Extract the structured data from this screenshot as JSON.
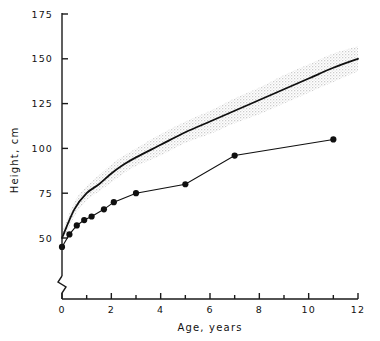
{
  "figure": {
    "name": "growth-chart",
    "background_color": "#ffffff",
    "axis_color": "#1a1a1a",
    "band_color": "#dcdcdc",
    "reference_curve_color": "#101010",
    "patient_curve_color": "#101010"
  },
  "chart_data": {
    "type": "line",
    "title": "",
    "xlabel": "Age, years",
    "ylabel": "Height, cm",
    "xlim": [
      0,
      12
    ],
    "ylim": [
      40,
      175
    ],
    "grid": false,
    "legend": "none",
    "y_axis_break": true,
    "y_axis_break_note": "axis broken between 0 and 40 cm",
    "xticks": [
      0,
      2,
      4,
      6,
      8,
      10,
      12
    ],
    "xtick_labels": [
      "0",
      "2",
      "4",
      "6",
      "8",
      "10",
      "12"
    ],
    "x_minor_ticks": [
      1,
      3,
      5,
      7,
      9,
      11
    ],
    "yticks": [
      50,
      75,
      100,
      125,
      150,
      175
    ],
    "ytick_labels": [
      "50",
      "75",
      "100",
      "125",
      "150",
      "175"
    ],
    "series": [
      {
        "name": "Reference median height",
        "style": "smooth-line-with-shaded-band",
        "x": [
          0,
          0.5,
          1,
          1.5,
          2,
          2.5,
          3,
          4,
          5,
          6,
          7,
          8,
          9,
          10,
          11,
          12
        ],
        "values": [
          50,
          66,
          75,
          80,
          86,
          91,
          95,
          102,
          109,
          115,
          121,
          127,
          133,
          139,
          145,
          150
        ],
        "band_lower": [
          47,
          62,
          71,
          76,
          81,
          86,
          90,
          96,
          103,
          108,
          114,
          119,
          125,
          131,
          137,
          143
        ],
        "band_upper": [
          53,
          70,
          79,
          85,
          91,
          96,
          100,
          108,
          115,
          121,
          128,
          134,
          141,
          147,
          153,
          157
        ]
      },
      {
        "name": "Patient height",
        "style": "markers-with-straight-segments",
        "x": [
          0,
          0.3,
          0.6,
          0.9,
          1.2,
          1.7,
          2.1,
          3.0,
          5.0,
          7.0,
          11.0
        ],
        "values": [
          45,
          52,
          57,
          60,
          62,
          66,
          70,
          75,
          80,
          96,
          105
        ]
      }
    ]
  },
  "labels": {
    "x_axis_title": "Age, years",
    "y_axis_title": "Height, cm"
  }
}
